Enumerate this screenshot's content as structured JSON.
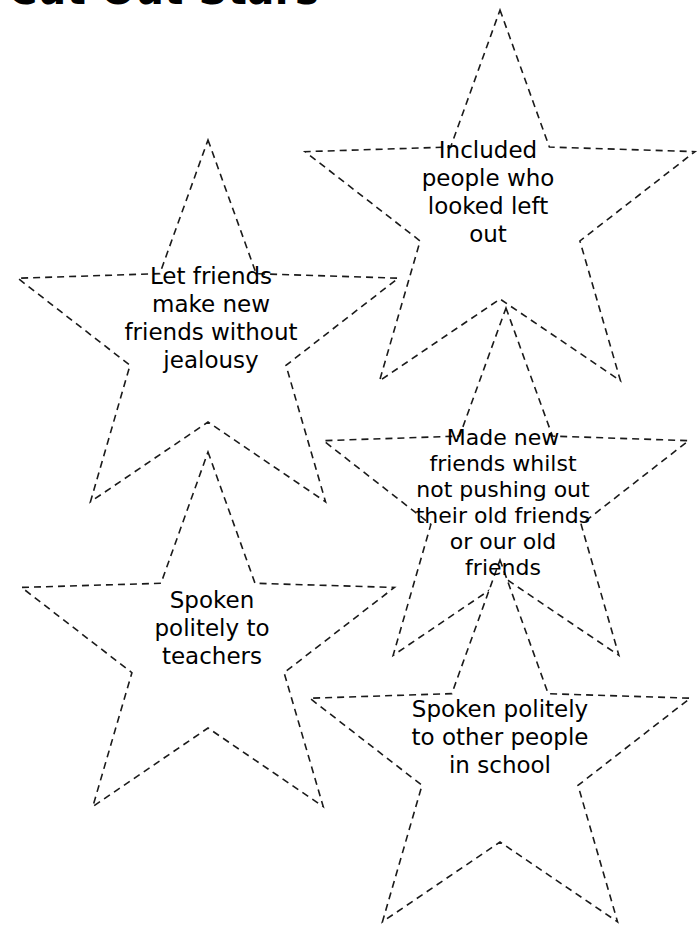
{
  "page": {
    "title": "Cut Out Stars",
    "background_color": "#ffffff",
    "ink_color": "#000000",
    "width": 699,
    "height": 942
  },
  "stars": [
    {
      "id": "star-included",
      "text": "Included\npeople who\nlooked left\nout",
      "position": "top-right",
      "outline_style": "dashed",
      "cx": 500,
      "cy": 215,
      "outer_r": 205,
      "inner_r": 84,
      "rotation": 0
    },
    {
      "id": "star-let-friends",
      "text": "Let friends\nmake new\nfriends without\njealousy",
      "position": "upper-left",
      "outline_style": "dashed",
      "cx": 208,
      "cy": 340,
      "outer_r": 200,
      "inner_r": 82,
      "rotation": 0
    },
    {
      "id": "star-made-new-friends",
      "text": "Made new\nfriends whilst\nnot pushing out\ntheir old friends\nor our old\nfriends",
      "position": "middle-right",
      "outline_style": "dashed",
      "cx": 506,
      "cy": 500,
      "outer_r": 192,
      "inner_r": 79,
      "rotation": 0
    },
    {
      "id": "star-spoken-teachers",
      "text": "Spoken\npolitely to\nteachers",
      "position": "lower-left",
      "outline_style": "dashed",
      "cx": 208,
      "cy": 648,
      "outer_r": 196,
      "inner_r": 80,
      "rotation": 0
    },
    {
      "id": "star-spoken-school",
      "text": "Spoken politely\nto other people\nin school",
      "position": "bottom-right",
      "outline_style": "dashed",
      "cx": 500,
      "cy": 760,
      "outer_r": 200,
      "inner_r": 82,
      "rotation": 0
    }
  ]
}
